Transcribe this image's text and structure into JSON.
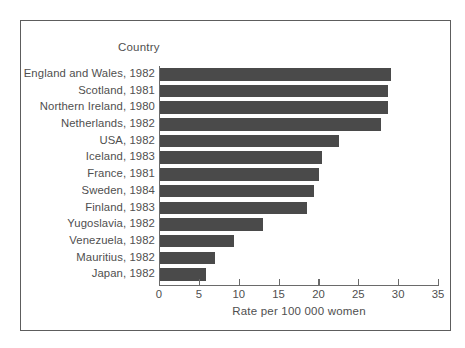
{
  "chart_data": {
    "type": "bar",
    "orientation": "horizontal",
    "title": "",
    "category_axis_title": "Country",
    "xlabel": "Rate per 100 000 women",
    "ylabel": "Country",
    "xlim": [
      0,
      35
    ],
    "xticks": [
      0,
      5,
      10,
      15,
      20,
      25,
      30,
      35
    ],
    "xtick_labels": [
      "0",
      "5",
      "10",
      "15",
      "20",
      "25",
      "30",
      "35"
    ],
    "grid": false,
    "legend": null,
    "bar_color": "#4a4a4a",
    "axis_color": "#6a6a6a",
    "text_color": "#4f4f4f",
    "categories": [
      "England and Wales, 1982",
      "Scotland, 1981",
      "Northern Ireland, 1980",
      "Netherlands, 1982",
      "USA, 1982",
      "Iceland, 1983",
      "France, 1981",
      "Sweden, 1984",
      "Finland, 1983",
      "Yugoslavia, 1982",
      "Venezuela, 1982",
      "Mauritius, 1982",
      "Japan, 1982"
    ],
    "values": [
      29.0,
      28.6,
      28.6,
      27.7,
      22.4,
      20.3,
      19.9,
      19.3,
      18.4,
      12.9,
      9.3,
      6.9,
      5.8
    ]
  }
}
